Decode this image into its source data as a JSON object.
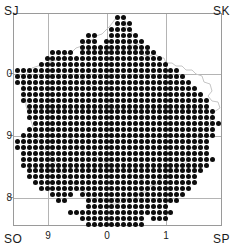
{
  "figure": {
    "type": "distribution-atlas-map"
  },
  "grid_squares": {
    "top_left": "SJ",
    "top_right": "SK",
    "bottom_left": "SO",
    "bottom_right": "SP"
  },
  "axes": {
    "x_ticks": [
      {
        "label": "9",
        "px": 48
      },
      {
        "label": "0",
        "px": 107
      },
      {
        "label": "1",
        "px": 166
      }
    ],
    "y_ticks": [
      {
        "label": "0",
        "px": 74
      },
      {
        "label": "9",
        "px": 136
      },
      {
        "label": "8",
        "px": 198
      }
    ]
  },
  "colors": {
    "dot": "#0d0d0d",
    "frame": "#9a9a9a",
    "gridline": "#b4b4b4",
    "outline": "#c8c8c8",
    "background": "#ffffff",
    "text": "#1a1a1a"
  },
  "chart_data": {
    "type": "scatter",
    "title": "",
    "xlabel": "",
    "ylabel": "",
    "grid": true,
    "legend": null,
    "dot_symbol": "filled-circle",
    "dot_count": 737,
    "grid_origin_px": [
      16.5,
      16.5
    ],
    "grid_step_px": 5.9,
    "grid_cols": 35,
    "grid_rows": 36,
    "occupancy_rows": [
      "00000000000000000110000000000000000",
      "00000000000000000111000000000000000",
      "00000000000000001111000000000000000",
      "00000000000011001111100000000000000",
      "00000000000111011111110000000000000",
      "00000000000111111111111000000000000",
      "00000011110111111111111100000000000",
      "00000111111111111111111110000000000",
      "00001111111111111111111111000000000",
      "11111111111111111111111111110000000",
      "11111111111111111111111111111000000",
      "11111111111111111111111111111100000",
      "01111111111111111111111111111110000",
      "01111111111111111111111111111111000",
      "01111111111111111111111111111111100",
      "00111111111111111111111111111111100",
      "00111111111111111111111111111111110",
      "00111111111111111111111111111111110",
      "00011111111111111111111111111111111",
      "00111111111111111111111111111111110",
      "01111111111111111111111111111111110",
      "11111111111111111111111111111111100",
      "11111111111111111111111111111111100",
      "01111111111111111111111111111111100",
      "01111111111111111111111111111111110",
      "01111111111111111111111111111111100",
      "00111111111111111111111111111111000",
      "00111111111111111111111111111110000",
      "00011111111111111111111111111110000",
      "00001111111111111111111111111100000",
      "00000011110111111111111111111000000",
      "00000001100011111111111111110000000",
      "00000000000011111111111111000000000",
      "00000000011111111111111111100000000",
      "00000000000111111111110111000000000",
      "00000000000011111111110000000000000"
    ]
  }
}
